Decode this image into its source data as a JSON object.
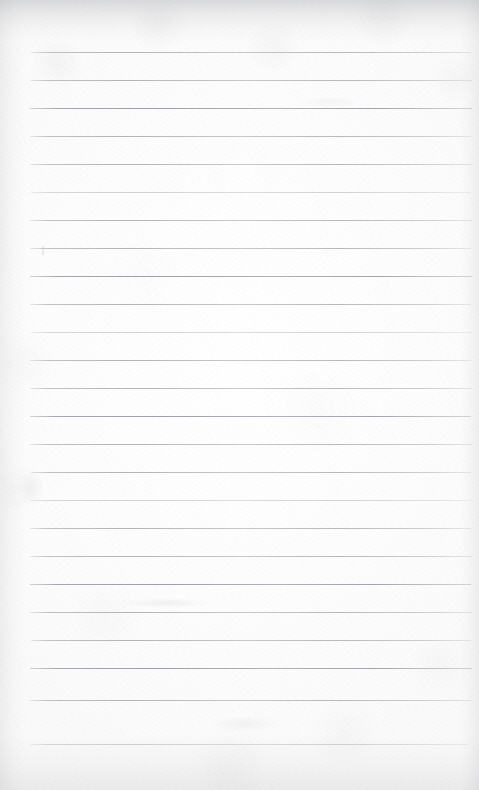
{
  "document": {
    "kind": "scanned-lined-notebook-page",
    "title": "Blank lined notebook page",
    "description": "A scanned blank sheet of ruled notebook paper. No handwriting, no printed text, no header or footer is present. Only faint horizontal ruled lines and paper texture are visible.",
    "text_content": "",
    "page_width": 479,
    "page_height": 790,
    "background_color": "#fdfdfd",
    "rule_color": "#b2b4ba",
    "edge_shadow_color": "#8a8c91"
  },
  "ruling": {
    "label": "ruled lines",
    "line_count": 25,
    "spacing_px": 28,
    "first_line_y": 52,
    "last_line_y": 744,
    "left_margin_x": 30,
    "right_margin_x": 471,
    "line_thickness_px": 1,
    "lines": [
      {
        "y": 52,
        "x1": 31,
        "x2": 471,
        "weight": "normal"
      },
      {
        "y": 80,
        "x1": 30,
        "x2": 472,
        "weight": "normal"
      },
      {
        "y": 108,
        "x1": 30,
        "x2": 472,
        "weight": "heavy"
      },
      {
        "y": 136,
        "x1": 30,
        "x2": 471,
        "weight": "normal"
      },
      {
        "y": 164,
        "x1": 30,
        "x2": 472,
        "weight": "normal"
      },
      {
        "y": 192,
        "x1": 31,
        "x2": 471,
        "weight": "faint"
      },
      {
        "y": 220,
        "x1": 30,
        "x2": 472,
        "weight": "normal"
      },
      {
        "y": 248,
        "x1": 30,
        "x2": 471,
        "weight": "normal"
      },
      {
        "y": 276,
        "x1": 30,
        "x2": 472,
        "weight": "heavy"
      },
      {
        "y": 304,
        "x1": 30,
        "x2": 471,
        "weight": "normal"
      },
      {
        "y": 332,
        "x1": 31,
        "x2": 472,
        "weight": "faint"
      },
      {
        "y": 360,
        "x1": 30,
        "x2": 471,
        "weight": "normal"
      },
      {
        "y": 388,
        "x1": 30,
        "x2": 472,
        "weight": "normal"
      },
      {
        "y": 416,
        "x1": 30,
        "x2": 471,
        "weight": "heavy"
      },
      {
        "y": 444,
        "x1": 30,
        "x2": 472,
        "weight": "normal"
      },
      {
        "y": 472,
        "x1": 31,
        "x2": 471,
        "weight": "normal"
      },
      {
        "y": 500,
        "x1": 30,
        "x2": 472,
        "weight": "faint"
      },
      {
        "y": 528,
        "x1": 30,
        "x2": 471,
        "weight": "normal"
      },
      {
        "y": 556,
        "x1": 30,
        "x2": 472,
        "weight": "normal"
      },
      {
        "y": 584,
        "x1": 30,
        "x2": 471,
        "weight": "heavy"
      },
      {
        "y": 612,
        "x1": 30,
        "x2": 472,
        "weight": "normal"
      },
      {
        "y": 640,
        "x1": 31,
        "x2": 471,
        "weight": "normal"
      },
      {
        "y": 668,
        "x1": 30,
        "x2": 472,
        "weight": "heavy"
      },
      {
        "y": 700,
        "x1": 30,
        "x2": 471,
        "weight": "normal"
      },
      {
        "y": 744,
        "x1": 30,
        "x2": 468,
        "weight": "faint"
      }
    ]
  },
  "marks": {
    "label": "incidental scan marks",
    "items": [
      {
        "name": "faint-tick-mark",
        "x": 42,
        "y": 246,
        "width": 2,
        "height": 9,
        "opacity": 0.45
      },
      {
        "name": "faint-smudge-left",
        "x": 18,
        "y": 470,
        "width": 26,
        "height": 34,
        "opacity": 0.1
      },
      {
        "name": "faint-smudge-mid",
        "x": 120,
        "y": 598,
        "width": 90,
        "height": 10,
        "opacity": 0.12
      },
      {
        "name": "faint-smudge-upper",
        "x": 300,
        "y": 96,
        "width": 60,
        "height": 12,
        "opacity": 0.08
      },
      {
        "name": "faint-smudge-lower",
        "x": 210,
        "y": 716,
        "width": 70,
        "height": 16,
        "opacity": 0.09
      }
    ]
  }
}
